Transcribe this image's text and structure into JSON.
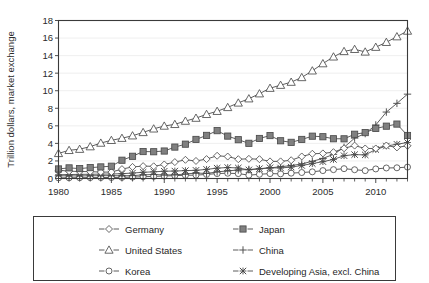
{
  "chart_data": {
    "type": "line",
    "title": "",
    "xlabel": "",
    "ylabel": "Trillion dollars, market exchange",
    "xlim": [
      1980,
      2013
    ],
    "ylim": [
      0,
      18
    ],
    "ytick_labels": [
      "0",
      "2",
      "4",
      "6",
      "8",
      "10",
      "12",
      "14",
      "16",
      "18"
    ],
    "yticks": [
      0,
      2,
      4,
      6,
      8,
      10,
      12,
      14,
      16,
      18
    ],
    "xtick_labels": [
      "1980",
      "1985",
      "1990",
      "1995",
      "2000",
      "2005",
      "2010"
    ],
    "xticks": [
      1980,
      1985,
      1990,
      1995,
      2000,
      2005,
      2010
    ],
    "grid": true,
    "legend_position": "below",
    "x": [
      1980,
      1981,
      1982,
      1983,
      1984,
      1985,
      1986,
      1987,
      1988,
      1989,
      1990,
      1991,
      1992,
      1993,
      1994,
      1995,
      1996,
      1997,
      1998,
      1999,
      2000,
      2001,
      2002,
      2003,
      2004,
      2005,
      2006,
      2007,
      2008,
      2009,
      2010,
      2011,
      2012,
      2013
    ],
    "series": [
      {
        "name": "Germany",
        "marker": "diamond",
        "marker_fill": "open",
        "values": [
          0.95,
          0.83,
          0.8,
          0.78,
          0.73,
          0.73,
          1.07,
          1.32,
          1.41,
          1.39,
          1.6,
          1.87,
          2.13,
          2.0,
          2.21,
          2.59,
          2.5,
          2.2,
          2.24,
          2.2,
          1.95,
          1.95,
          2.08,
          2.51,
          2.82,
          2.86,
          3.0,
          3.44,
          3.75,
          3.42,
          3.42,
          3.76,
          3.54,
          3.73
        ]
      },
      {
        "name": "Japan",
        "marker": "square",
        "marker_fill": "filled",
        "values": [
          1.09,
          1.21,
          1.13,
          1.24,
          1.32,
          1.4,
          2.08,
          2.53,
          3.07,
          3.05,
          3.13,
          3.58,
          3.91,
          4.45,
          4.91,
          5.45,
          4.83,
          4.42,
          4.01,
          4.56,
          4.89,
          4.3,
          4.12,
          4.45,
          4.82,
          4.76,
          4.53,
          4.52,
          5.04,
          5.23,
          5.7,
          5.96,
          6.2,
          4.9
        ]
      },
      {
        "name": "United States",
        "marker": "triangle",
        "marker_fill": "open",
        "values": [
          2.86,
          3.21,
          3.34,
          3.63,
          4.04,
          4.35,
          4.59,
          4.87,
          5.25,
          5.66,
          5.98,
          6.17,
          6.54,
          6.88,
          7.31,
          7.66,
          8.1,
          8.61,
          9.09,
          9.66,
          10.29,
          10.63,
          10.98,
          11.51,
          12.27,
          13.09,
          13.86,
          14.48,
          14.72,
          14.42,
          14.96,
          15.52,
          16.16,
          16.8
        ]
      },
      {
        "name": "China",
        "marker": "plus",
        "marker_fill": "open",
        "values": [
          0.31,
          0.3,
          0.29,
          0.31,
          0.32,
          0.32,
          0.31,
          0.33,
          0.41,
          0.46,
          0.4,
          0.42,
          0.5,
          0.63,
          0.57,
          0.75,
          0.87,
          0.97,
          1.03,
          1.1,
          1.21,
          1.34,
          1.47,
          1.66,
          1.96,
          2.29,
          2.75,
          3.55,
          4.6,
          5.12,
          6.1,
          7.57,
          8.56,
          9.61
        ]
      },
      {
        "name": "Korea",
        "marker": "circle",
        "marker_fill": "open",
        "values": [
          0.07,
          0.08,
          0.09,
          0.1,
          0.11,
          0.11,
          0.13,
          0.16,
          0.2,
          0.24,
          0.28,
          0.33,
          0.36,
          0.39,
          0.46,
          0.56,
          0.6,
          0.56,
          0.38,
          0.48,
          0.56,
          0.53,
          0.61,
          0.68,
          0.76,
          0.9,
          1.01,
          1.12,
          1.0,
          0.9,
          1.09,
          1.2,
          1.22,
          1.3
        ]
      },
      {
        "name": "Developing Asia, excl. China",
        "marker": "x",
        "marker_fill": "filled",
        "values": [
          0.43,
          0.45,
          0.47,
          0.48,
          0.5,
          0.51,
          0.55,
          0.62,
          0.71,
          0.76,
          0.83,
          0.85,
          0.9,
          0.93,
          1.04,
          1.18,
          1.25,
          1.2,
          0.98,
          1.12,
          1.22,
          1.2,
          1.3,
          1.48,
          1.7,
          1.92,
          2.17,
          2.6,
          2.72,
          2.69,
          3.3,
          3.7,
          3.9,
          4.1
        ]
      }
    ]
  },
  "legend": {
    "entries": [
      {
        "label": "Germany"
      },
      {
        "label": "Japan"
      },
      {
        "label": "United States"
      },
      {
        "label": "China"
      },
      {
        "label": "Korea"
      },
      {
        "label": "Developing Asia, excl. China"
      }
    ]
  },
  "colors": {
    "line": "#4b4b4b",
    "axis": "#3a3a3a",
    "grid": "#e8e8e8",
    "marker_fill_dark": "#808080",
    "text": "#1f1f1f",
    "background": "#ffffff"
  }
}
